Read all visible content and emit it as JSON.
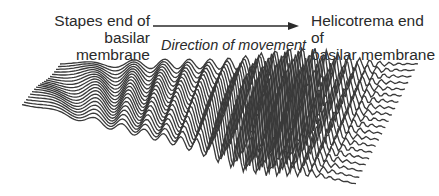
{
  "diagram": {
    "type": "traveling-wave-basilar-membrane",
    "left_label": [
      "Stapes end of",
      "basilar membrane"
    ],
    "right_label": [
      "Helicotrema end of",
      "basilar membrane"
    ],
    "arrow_label": "Direction of movement",
    "line_color": "#3a3a3a",
    "num_traces": 20
  }
}
